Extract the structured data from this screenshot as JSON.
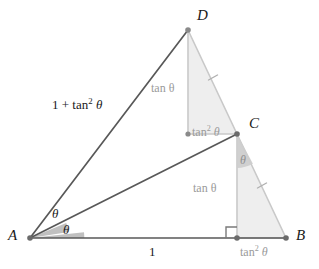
{
  "figure": {
    "type": "euclidean-construction"
  },
  "colors": {
    "background": "#ffffff",
    "stroke_dark": "#585858",
    "stroke_light": "#c9c9c9",
    "fill_shaded": "#eeeeee",
    "fill_angle_dark": "#c4c4c4",
    "fill_angle_light": "#cccccc",
    "text_dark": "#1a1a1a",
    "text_gray": "#9a9a9a",
    "vertex_dot": "#6b6b6b"
  },
  "vertices": [
    {
      "id": "A",
      "label": "A",
      "x": 30,
      "y": 238,
      "label_x": 8,
      "label_y": 231
    },
    {
      "id": "B",
      "label": "B",
      "x": 286,
      "y": 238,
      "label_x": 296,
      "label_y": 231
    },
    {
      "id": "C",
      "label": "C",
      "x": 237,
      "y": 134,
      "label_x": 247,
      "label_y": 119
    },
    {
      "id": "D",
      "label": "D",
      "x": 188,
      "y": 30,
      "label_x": 196,
      "label_y": 7
    },
    {
      "id": "E",
      "label": "",
      "x": 188,
      "y": 134,
      "label_x": 0,
      "label_y": 0
    },
    {
      "id": "F",
      "label": "",
      "x": 237,
      "y": 238,
      "label_x": 0,
      "label_y": 0
    }
  ],
  "segments": [
    {
      "name": "segment-AB",
      "from": "A",
      "to": "B",
      "shade": "dark"
    },
    {
      "name": "segment-AC",
      "from": "A",
      "to": "C",
      "shade": "dark"
    },
    {
      "name": "segment-AD",
      "from": "A",
      "to": "D",
      "shade": "dark"
    },
    {
      "name": "segment-DE",
      "from": "D",
      "to": "E",
      "shade": "light"
    },
    {
      "name": "segment-EC",
      "from": "E",
      "to": "C",
      "shade": "light"
    },
    {
      "name": "segment-DC",
      "from": "D",
      "to": "C",
      "shade": "light"
    },
    {
      "name": "segment-CF",
      "from": "C",
      "to": "F",
      "shade": "light"
    },
    {
      "name": "segment-FB",
      "from": "F",
      "to": "B",
      "shade": "light"
    },
    {
      "name": "segment-CB",
      "from": "C",
      "to": "B",
      "shade": "light"
    }
  ],
  "shaded_triangles": [
    {
      "name": "triangle-DEC",
      "points": "188,30 188,134 237,134"
    },
    {
      "name": "triangle-CFB",
      "points": "237,134 237,238 286,238"
    }
  ],
  "labels": {
    "side_AD": {
      "text": "1 + tan",
      "sup": "2",
      "tail": " θ",
      "x": 52,
      "y": 105
    },
    "side_AB": {
      "text": "1",
      "x": 150,
      "y": 246
    },
    "side_DE": {
      "text": "tan θ",
      "x": 152,
      "y": 82
    },
    "side_EC": {
      "text": "tan",
      "sup": "2",
      "tail": " θ",
      "x": 192,
      "y": 126
    },
    "side_CF": {
      "text": "tan θ",
      "x": 194,
      "y": 182
    },
    "side_FB": {
      "text": "tan",
      "sup": "2",
      "tail": " θ",
      "x": 241,
      "y": 245
    },
    "angle_A_upper": {
      "text": "θ",
      "x": 53,
      "y": 208
    },
    "angle_A_lower": {
      "text": "θ",
      "x": 63,
      "y": 223
    },
    "angle_C": {
      "text": "θ",
      "x": 240,
      "y": 155
    }
  },
  "angle_arcs": [
    {
      "name": "angle-arc-A-upper",
      "vertex": "A",
      "fill": "dark"
    },
    {
      "name": "angle-arc-A-lower",
      "vertex": "A",
      "fill": "dark"
    },
    {
      "name": "angle-arc-C",
      "vertex": "C",
      "fill": "light"
    }
  ],
  "right_angles": [
    {
      "name": "right-angle-marker-F",
      "at": "F",
      "size": 10
    }
  ],
  "tick_marks": [
    {
      "name": "congruence-tick-DC",
      "on": "segment-DC"
    },
    {
      "name": "congruence-tick-CB",
      "on": "segment-CB"
    }
  ]
}
